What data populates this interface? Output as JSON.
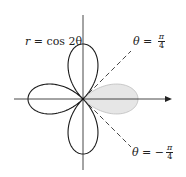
{
  "figure": {
    "curve_label": {
      "lhs": "r",
      "eq": " = ",
      "rhs": "cos 2θ"
    },
    "ray_upper": {
      "lhs": "θ",
      "eq": " = ",
      "sign": "",
      "num": "π",
      "den": "4"
    },
    "ray_lower": {
      "lhs": "θ",
      "eq": " = ",
      "sign": "−",
      "num": "π",
      "den": "4"
    },
    "colors": {
      "curve": "#1a1a1a",
      "axes": "#333333",
      "shaded_region": "#e6e6e6",
      "shaded_outline": "#bdbdbd",
      "rays": "#333333"
    },
    "geometry": {
      "origin": [
        83,
        99
      ],
      "petal_radius_px": 55,
      "shaded_petal": "right petal, -π/4 ≤ θ ≤ π/4"
    }
  }
}
